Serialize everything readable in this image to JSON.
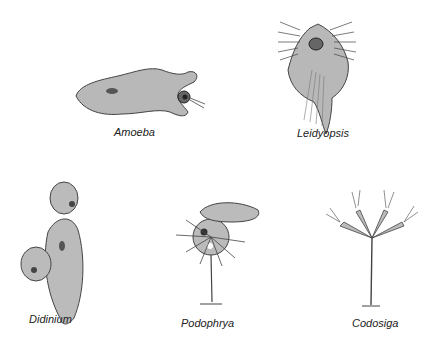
{
  "organisms": [
    {
      "name": "Amoeba"
    },
    {
      "name": "Leidyopsis"
    },
    {
      "name": "Didinium"
    },
    {
      "name": "Podophrya"
    },
    {
      "name": "Codosiga"
    }
  ],
  "colors": {
    "body_fill": "#b5b5b5",
    "outline": "#333333",
    "nucleus": "#444444"
  }
}
